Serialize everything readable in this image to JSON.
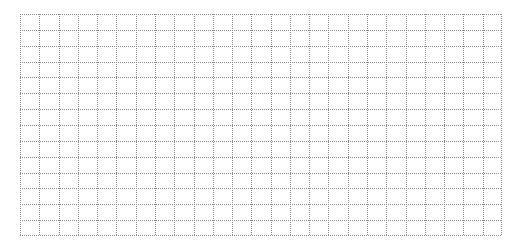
{
  "grid": {
    "columns": 25,
    "rows": 14,
    "left": 20,
    "top": 14,
    "width": 482,
    "height": 222,
    "line_color": "#8a8a8a",
    "line_style": "dotted",
    "background": "#ffffff"
  }
}
